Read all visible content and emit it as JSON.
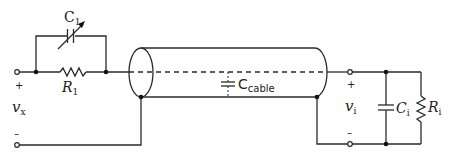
{
  "diagram": {
    "labels": {
      "c1_main": "C",
      "c1_sub": "1",
      "r1_main": "R",
      "r1_sub": "1",
      "vx_main": "v",
      "vx_sub": "x",
      "vx_plus": "+",
      "vx_minus": "–",
      "ccable_main": "C",
      "ccable_sub": "cable",
      "vi_main": "v",
      "vi_sub": "i",
      "vi_plus": "+",
      "vi_minus": "–",
      "ci_main": "C",
      "ci_sub": "i",
      "ri_main": "R",
      "ri_sub": "i"
    },
    "components": [
      {
        "id": "C1",
        "type": "variable-capacitor",
        "position": "top loop, parallel to R1"
      },
      {
        "id": "R1",
        "type": "resistor",
        "position": "series input"
      },
      {
        "id": "Ccable",
        "type": "capacitor",
        "position": "inside coaxial cable"
      },
      {
        "id": "Ci",
        "type": "capacitor",
        "position": "scope input shunt"
      },
      {
        "id": "Ri",
        "type": "resistor",
        "position": "scope input shunt"
      }
    ],
    "colors": {
      "line": "#2a2a2a",
      "background": "#ffffff"
    }
  }
}
